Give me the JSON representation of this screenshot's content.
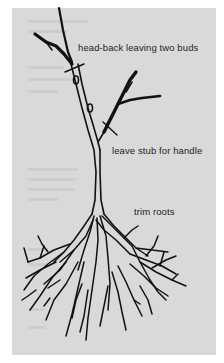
{
  "diagram": {
    "labels": {
      "head_back": "head-back leaving two buds",
      "stub": "leave stub for handle",
      "roots": "trim roots"
    },
    "colors": {
      "background": "#d9d9d9",
      "margin": "#ffffff",
      "ink": "#111111"
    }
  }
}
